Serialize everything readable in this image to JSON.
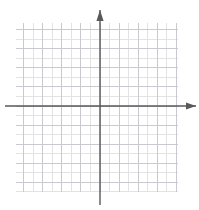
{
  "figure": {
    "type": "blank-coordinate-grid",
    "title": "",
    "background_color": "#ffffff"
  },
  "chart_data": {
    "type": "scatter",
    "title": "",
    "subtitle": "",
    "xlabel": "",
    "ylabel": "",
    "series": [],
    "x": [],
    "values": [],
    "categories": [],
    "xlim": [
      -9,
      8
    ],
    "ylim": [
      -9,
      9
    ],
    "grid": true,
    "grid_on": true,
    "legend": false,
    "legend_position": "none",
    "x_tick_labels": [],
    "y_tick_labels": [],
    "annotations": []
  },
  "grid": {
    "cell_size_px": 9.53,
    "columns": 17,
    "rows": 17.7,
    "left_px": 16,
    "top_px": 23,
    "right_px": 178,
    "bottom_px": 192,
    "minor_color": "#e3e3e6",
    "major_color": "#c9c9cf",
    "major_every": 2
  },
  "axes": {
    "origin_x_px": 100,
    "origin_y_px": 106,
    "color": "#595959",
    "stroke_width_px": 1.4,
    "x_axis": {
      "name": "x-axis",
      "start_px": 5,
      "end_px": 196,
      "arrow_end": "right"
    },
    "y_axis": {
      "name": "y-axis",
      "start_px": 10,
      "end_px": 205,
      "arrow_end": "up"
    }
  },
  "arrows": {
    "up_arrow": {
      "name": "y-axis-arrowhead",
      "direction": "up"
    },
    "right_arrow": {
      "name": "x-axis-arrowhead",
      "direction": "right"
    }
  }
}
